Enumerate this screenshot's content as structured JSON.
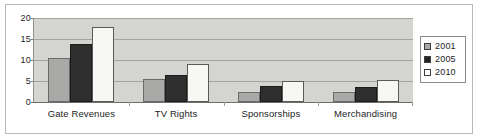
{
  "chart_data": {
    "type": "bar",
    "title": "",
    "subtitle": "",
    "xlabel": "",
    "ylabel": "",
    "categories": [
      "Gate Revenues",
      "TV Rights",
      "Sponsorships",
      "Merchandising"
    ],
    "series": [
      {
        "name": "2001",
        "color": "#a9a9a7",
        "values": [
          10.5,
          5.5,
          2.3,
          2.4
        ]
      },
      {
        "name": "2005",
        "color": "#2f2f2f",
        "values": [
          13.7,
          6.4,
          3.7,
          3.6
        ]
      },
      {
        "name": "2010",
        "color": "#f7f7f3",
        "values": [
          17.9,
          9.0,
          5.0,
          5.2
        ]
      }
    ],
    "ylim": [
      0,
      20
    ],
    "yticks": [
      0,
      5,
      10,
      15,
      20
    ],
    "ytick_labels": [
      "0",
      "5",
      "10",
      "15",
      "20"
    ],
    "grid": true,
    "grid_axis": "y",
    "legend": [
      "2001",
      "2005",
      "2010"
    ],
    "legend_position": "right",
    "plot_background": "#d4d4d0",
    "figure_background": "#ffffff",
    "border_color": "#b9b9b9"
  }
}
